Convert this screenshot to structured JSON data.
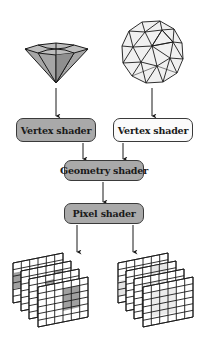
{
  "diagram": {
    "title": "",
    "inputs": [
      {
        "id": "diamond",
        "label": "",
        "shape": "diamond-mesh",
        "fill": "#9e9e9e"
      },
      {
        "id": "sphere",
        "label": "",
        "shape": "geodesic-sphere-mesh",
        "fill": "#f0f0f0"
      }
    ],
    "nodes": [
      {
        "id": "vs-left",
        "label": "Vertex shader",
        "fill": "#a9a9a9"
      },
      {
        "id": "vs-right",
        "label": "Vertex shader",
        "fill": "#fbfbfb"
      },
      {
        "id": "geom",
        "label": "Geometry shader",
        "fill": "#a9a9a9"
      },
      {
        "id": "pixel",
        "label": "Pixel shader",
        "fill": "#a9a9a9"
      }
    ],
    "outputs": [
      {
        "id": "grid-stack-left",
        "label": "",
        "shape": "stacked-pixel-grids",
        "highlight": "#a0a0a0"
      },
      {
        "id": "grid-stack-right",
        "label": "",
        "shape": "stacked-pixel-grids",
        "highlight": "#e6e6e6"
      }
    ],
    "edges": [
      {
        "from": "diamond",
        "to": "vs-left"
      },
      {
        "from": "sphere",
        "to": "vs-right"
      },
      {
        "from": "vs-left",
        "to": "geom"
      },
      {
        "from": "vs-right",
        "to": "geom"
      },
      {
        "from": "geom",
        "to": "pixel"
      },
      {
        "from": "pixel",
        "to": "grid-stack-left"
      },
      {
        "from": "pixel",
        "to": "grid-stack-right"
      }
    ],
    "colors": {
      "stroke": "#1a1a1a",
      "box_border": "#3a3a3a",
      "dark_fill": "#a9a9a9",
      "light_fill": "#fbfbfb"
    }
  }
}
